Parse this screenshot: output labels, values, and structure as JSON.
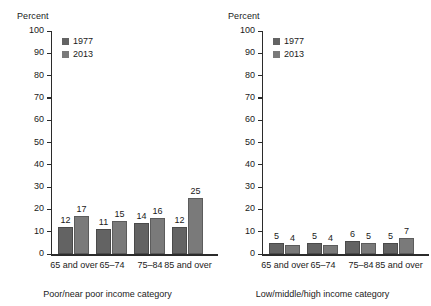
{
  "chart_data": [
    {
      "type": "bar",
      "title": "",
      "ylabel": "Percent",
      "xlabel": "Poor/near poor income category",
      "categories": [
        "65 and over",
        "65–74",
        "75–84",
        "85 and over"
      ],
      "series": [
        {
          "name": "1977",
          "values": [
            12,
            11,
            14,
            12
          ],
          "color": "#636363"
        },
        {
          "name": "2013",
          "values": [
            17,
            15,
            16,
            25
          ],
          "color": "#7a7a7a"
        }
      ],
      "ylim": [
        0,
        100
      ],
      "yticks": [
        0,
        10,
        20,
        30,
        40,
        50,
        60,
        70,
        80,
        90,
        100
      ],
      "grid": false,
      "legend_position": "top-left"
    },
    {
      "type": "bar",
      "title": "",
      "ylabel": "Percent",
      "xlabel": "Low/middle/high income category",
      "categories": [
        "65 and over",
        "65–74",
        "75–84",
        "85 and over"
      ],
      "series": [
        {
          "name": "1977",
          "values": [
            5,
            5,
            6,
            5
          ],
          "color": "#636363"
        },
        {
          "name": "2013",
          "values": [
            4,
            4,
            5,
            7
          ],
          "color": "#7a7a7a"
        }
      ],
      "ylim": [
        0,
        100
      ],
      "yticks": [
        0,
        10,
        20,
        30,
        40,
        50,
        60,
        70,
        80,
        90,
        100
      ],
      "grid": false,
      "legend_position": "top-left"
    }
  ]
}
